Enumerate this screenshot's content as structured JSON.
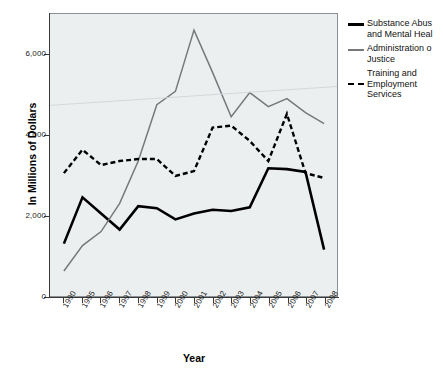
{
  "chart_data": {
    "type": "line",
    "title": "",
    "xlabel": "Year",
    "ylabel": "In Millions of Dollars",
    "categories": [
      "1990",
      "1995",
      "1996",
      "1997",
      "1998",
      "1999",
      "2000",
      "2001",
      "2002",
      "2003",
      "2004",
      "2005",
      "2006",
      "2007",
      "2008"
    ],
    "ylim": [
      0,
      7000
    ],
    "yticks": [
      0,
      2000,
      4000,
      6000
    ],
    "ytick_labels": [
      "0",
      "2,000",
      "4,000",
      "6,000"
    ],
    "grid": false,
    "legend_position": "right",
    "series": [
      {
        "name": "Substance Abus",
        "name_line2": "and Mental Heal",
        "style": "solid-thick",
        "color": "#000000",
        "values": [
          1300,
          2450,
          2050,
          1650,
          2230,
          2180,
          1900,
          2050,
          2140,
          2110,
          2200,
          3170,
          3150,
          3080,
          1150
        ]
      },
      {
        "name": "Administration o",
        "name_line2": "Justice",
        "style": "solid-thin",
        "color": "#77787b",
        "values": [
          620,
          1250,
          1600,
          2300,
          3350,
          4750,
          5080,
          6600,
          5550,
          4450,
          5050,
          4700,
          4900,
          4550,
          4280
        ]
      },
      {
        "name": "Training and",
        "name_line2": "Employment",
        "name_line3": "Services",
        "style": "dashed",
        "color": "#000000",
        "values": [
          3050,
          3630,
          3250,
          3350,
          3400,
          3400,
          2980,
          3100,
          4180,
          4230,
          3850,
          3350,
          4520,
          3050,
          2930
        ]
      }
    ]
  },
  "axes": {
    "y_title": "In Millions of Dollars",
    "x_title": "Year",
    "y_tick_labels": [
      "6,000",
      "4,000",
      "2,000",
      "0"
    ],
    "x_tick_labels": [
      "1990",
      "1995",
      "1996",
      "1997",
      "1998",
      "1999",
      "2000",
      "2001",
      "2002",
      "2003",
      "2004",
      "2005",
      "2006",
      "2007",
      "2008"
    ]
  },
  "legend": {
    "items": [
      {
        "label_line1": "Substance Abus",
        "label_line2": "and Mental Heal",
        "swatch": "solid-thick-line-icon"
      },
      {
        "label_line1": "Administration o",
        "label_line2": "Justice",
        "swatch": "solid-thin-line-icon"
      },
      {
        "label_line1": "Training and",
        "label_line2": "Employment",
        "label_line3": "Services",
        "swatch": "dashed-line-icon"
      }
    ]
  },
  "colors": {
    "plot_background": "#eceff0",
    "frame": "#8b9094",
    "series_1": "#000000",
    "series_2": "#77787b",
    "series_3": "#000000"
  }
}
